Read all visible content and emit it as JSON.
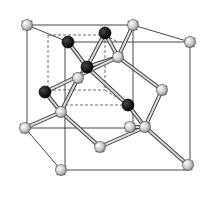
{
  "diagram": {
    "atom_types": {
      "light": {
        "label": "light atom",
        "fill": "#cfcfcf",
        "stroke": "#555555"
      },
      "dark": {
        "label": "dark atom",
        "fill": "#111111",
        "stroke": "#000000"
      }
    },
    "atom_counts": {
      "light": 13,
      "dark": 5
    }
  }
}
